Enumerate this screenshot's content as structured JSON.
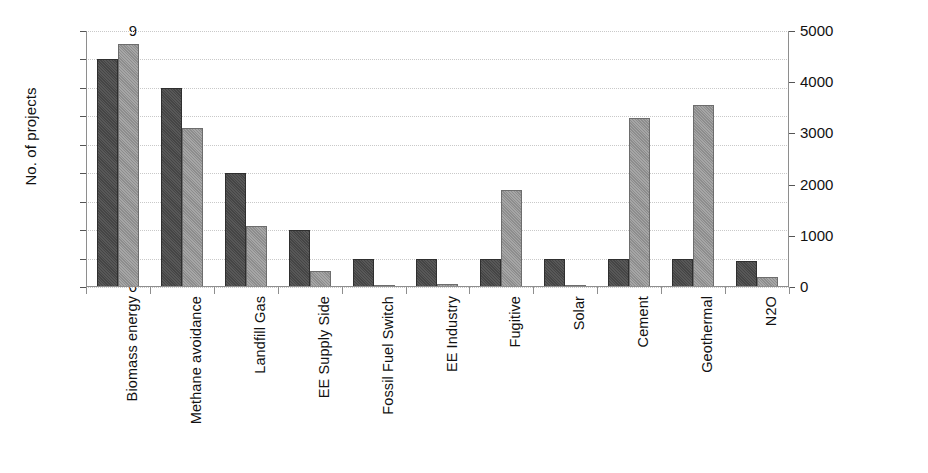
{
  "chart_data": {
    "type": "bar",
    "title": "",
    "xlabel": "",
    "grid": true,
    "legend_position": "none",
    "categories": [
      "Biomass energy",
      "Methane avoidance",
      "Landfill Gas",
      "EE Supply Side",
      "Fossil Fuel Switch",
      "EE Industry",
      "Fugitive",
      "Solar",
      "Cement",
      "Geothermal",
      "N2O"
    ],
    "series": [
      {
        "name": "No. of projects",
        "axis": "left",
        "color": "#454545",
        "values": [
          8,
          7,
          4,
          2,
          1,
          1,
          1,
          1,
          1,
          1,
          0.9
        ]
      },
      {
        "name": "Expected CERs",
        "axis": "right",
        "color": "#8d8d8d",
        "values": [
          4750,
          3100,
          1200,
          320,
          40,
          60,
          1900,
          30,
          3300,
          3550,
          200
        ]
      }
    ],
    "left_axis": {
      "label": "No. of projects",
      "min": 0,
      "max": 9,
      "step": 1,
      "ticks": [
        "0",
        "1",
        "2",
        "3",
        "4",
        "5",
        "6",
        "7",
        "8",
        "9"
      ]
    },
    "right_axis": {
      "label": "Expected CERs",
      "min": 0,
      "max": 5000,
      "step": 1000,
      "ticks": [
        "0",
        "1000",
        "2000",
        "3000",
        "4000",
        "5000"
      ]
    }
  }
}
